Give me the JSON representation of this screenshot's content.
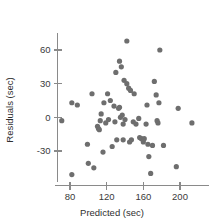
{
  "chart_data": {
    "type": "scatter",
    "title": "",
    "subtitle": "",
    "xlabel": "Predicted (sec)",
    "ylabel": "Residuals (sec)",
    "xlim": [
      64,
      232
    ],
    "ylim": [
      -58,
      75
    ],
    "xticks": [
      80,
      120,
      160,
      200
    ],
    "xticklabels": [
      "80",
      "120",
      "160",
      "200"
    ],
    "yticks": [
      -30,
      0,
      30,
      60
    ],
    "yticklabels": [
      "-30",
      "0",
      "30",
      "60"
    ],
    "grid": false,
    "legend": null,
    "marker_color": "#6e6e6e",
    "axis_color": "#8a8a8a",
    "marker_radius": 2.6,
    "series": [
      {
        "name": "residuals",
        "points": [
          [
            71,
            -3
          ],
          [
            82,
            13
          ],
          [
            82,
            -51
          ],
          [
            88,
            11
          ],
          [
            99,
            -24
          ],
          [
            100,
            -41
          ],
          [
            104,
            21
          ],
          [
            106,
            -45
          ],
          [
            110,
            -8
          ],
          [
            111,
            -10
          ],
          [
            112,
            -11
          ],
          [
            113,
            -3
          ],
          [
            114,
            3
          ],
          [
            116,
            -31
          ],
          [
            117,
            13
          ],
          [
            119,
            -5
          ],
          [
            121,
            21
          ],
          [
            122,
            -2
          ],
          [
            124,
            15
          ],
          [
            126,
            -26
          ],
          [
            128,
            10
          ],
          [
            129,
            -4
          ],
          [
            130,
            40
          ],
          [
            131,
            -20
          ],
          [
            133,
            8
          ],
          [
            134,
            9
          ],
          [
            134,
            50
          ],
          [
            135,
            0
          ],
          [
            136,
            45
          ],
          [
            137,
            2
          ],
          [
            138,
            -6
          ],
          [
            138,
            -20
          ],
          [
            139,
            33
          ],
          [
            140,
            -2
          ],
          [
            142,
            30
          ],
          [
            142,
            68
          ],
          [
            144,
            26
          ],
          [
            145,
            -22
          ],
          [
            146,
            24
          ],
          [
            147,
            -20
          ],
          [
            149,
            -4
          ],
          [
            150,
            21
          ],
          [
            152,
            -6
          ],
          [
            155,
            -1
          ],
          [
            156,
            -18
          ],
          [
            158,
            -19
          ],
          [
            160,
            -22
          ],
          [
            161,
            -19
          ],
          [
            163,
            -6
          ],
          [
            164,
            11
          ],
          [
            165,
            -24
          ],
          [
            166,
            -35
          ],
          [
            168,
            -50
          ],
          [
            170,
            -25
          ],
          [
            172,
            32
          ],
          [
            174,
            20
          ],
          [
            175,
            -3
          ],
          [
            176,
            -5
          ],
          [
            177,
            13
          ],
          [
            178,
            60
          ],
          [
            182,
            -25
          ],
          [
            196,
            -44
          ],
          [
            198,
            8
          ],
          [
            213,
            -5
          ]
        ]
      }
    ]
  }
}
